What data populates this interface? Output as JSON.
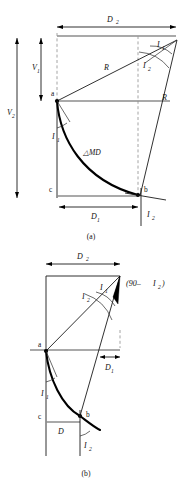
{
  "figure": {
    "type": "engineering-diagram",
    "panels": [
      {
        "id": "a",
        "caption": "(a)",
        "points": [
          {
            "key": "a",
            "label": "a"
          },
          {
            "key": "b",
            "label": "b"
          },
          {
            "key": "c",
            "label": "c"
          }
        ],
        "dimensions": [
          {
            "key": "D2",
            "label": "D",
            "sub": "2"
          },
          {
            "key": "D1",
            "label": "D",
            "sub": "1"
          },
          {
            "key": "V1",
            "label": "V",
            "sub": "1"
          },
          {
            "key": "V2",
            "label": "V",
            "sub": "2"
          }
        ],
        "angles": [
          {
            "key": "I1_top",
            "label": "I",
            "sub": "1"
          },
          {
            "key": "I2_top",
            "label": "I",
            "sub": "2"
          },
          {
            "key": "I1_a",
            "label": "I",
            "sub": "1"
          },
          {
            "key": "I2_b",
            "label": "I",
            "sub": "2"
          }
        ],
        "radii": [
          {
            "key": "R_upper",
            "label": "R"
          },
          {
            "key": "R_right",
            "label": "R"
          }
        ],
        "arc_label": {
          "key": "MD",
          "label": "△MD"
        }
      },
      {
        "id": "b",
        "caption": "(b)",
        "points": [
          {
            "key": "a",
            "label": "a"
          },
          {
            "key": "b",
            "label": "b"
          },
          {
            "key": "c",
            "label": "c"
          }
        ],
        "dimensions": [
          {
            "key": "D2",
            "label": "D",
            "sub": "2"
          },
          {
            "key": "D1",
            "label": "D",
            "sub": "1"
          },
          {
            "key": "D",
            "label": "D"
          }
        ],
        "angles": [
          {
            "key": "I2_top",
            "label": "I",
            "sub": "2"
          },
          {
            "key": "I1_top",
            "label": "I",
            "sub": "1"
          },
          {
            "key": "I1_a",
            "label": "I",
            "sub": "1"
          },
          {
            "key": "I2_b",
            "label": "I",
            "sub": "2"
          }
        ],
        "complement": {
          "key": "comp",
          "pre": "(90– ",
          "label": "I",
          "sub": "2",
          "post": ")"
        }
      }
    ]
  },
  "labels": {
    "D": "D",
    "V": "V",
    "I": "I",
    "R": "R",
    "a": "a",
    "b": "b",
    "c": "c",
    "one": "1",
    "two": "2",
    "delta_md": "△MD",
    "caption_a": "(a)",
    "caption_b": "(b)",
    "comp_pre": "(90– ",
    "comp_post": ")"
  },
  "colors": {
    "ink": "#111111",
    "curve": "#000000",
    "gray_rule": "#8c8c8c",
    "dashed": "#9a9a9a",
    "background": "#ffffff"
  }
}
